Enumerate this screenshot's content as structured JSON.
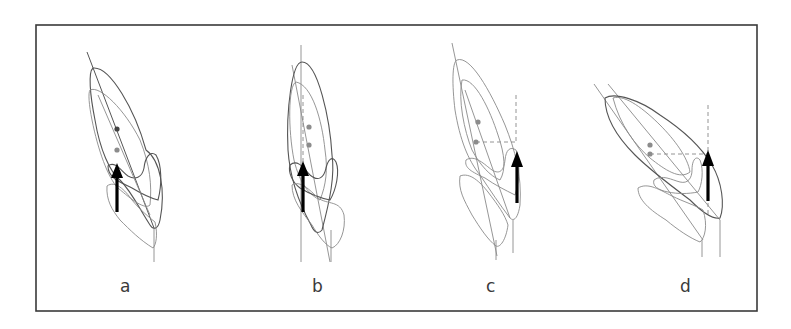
{
  "figure": {
    "frame": {
      "x": 36,
      "y": 25,
      "width": 721,
      "height": 286,
      "color": "#3a3a3a"
    },
    "colors": {
      "outline": "#8a8a8a",
      "outline_dark": "#555555",
      "dot_dark": "#444444",
      "dot_light": "#8c8c8c",
      "arrow": "#000000"
    },
    "panels": [
      {
        "id": "a",
        "label": "a",
        "description": "Tilted tooth outlines with force arrow below the centers"
      },
      {
        "id": "b",
        "label": "b",
        "description": "More upright outlines with dashed vertical reference and force arrow"
      },
      {
        "id": "c",
        "label": "c",
        "description": "Force arrow offset distally with dashed horizontal lever-arm to center"
      },
      {
        "id": "d",
        "label": "d",
        "description": "Strongly tipped outlines with offset force arrow and dashed lever-arm"
      }
    ]
  }
}
